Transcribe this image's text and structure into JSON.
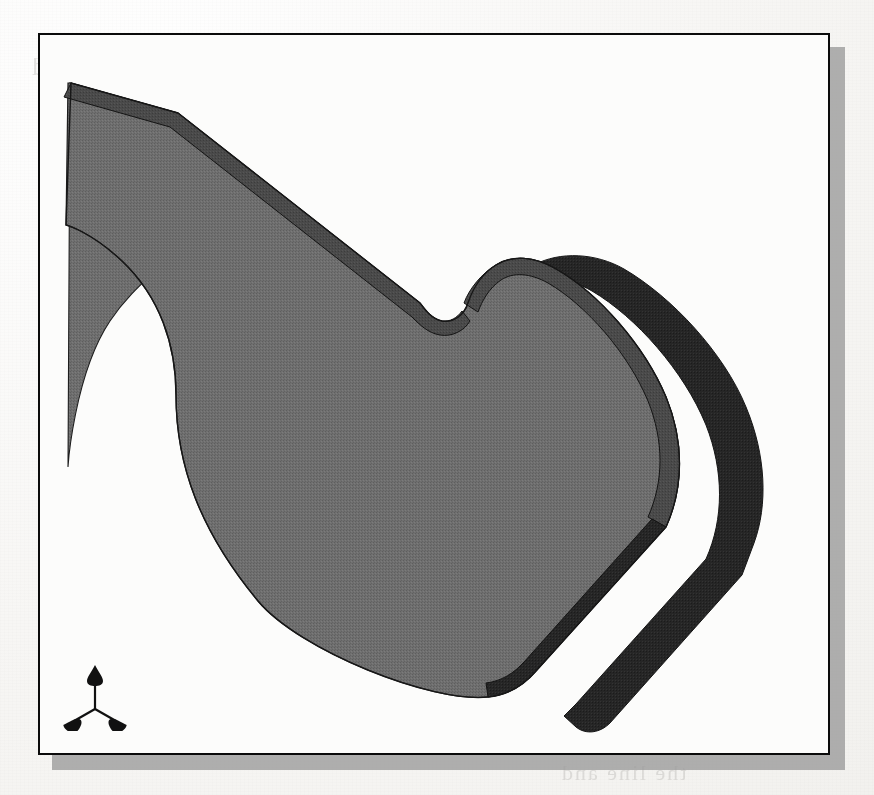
{
  "document": {
    "kind": "scanned-book-page",
    "page_background_color": "#f6f5f2",
    "ghost_text_color": "#7d7a76"
  },
  "ghost_text": {
    "note": "Faint mirrored bleed-through from the reverse side of the scanned page; mostly illegible.",
    "lines": [
      {
        "text": "positions size and length the Child",
        "x": 30,
        "y": 52,
        "size": 26
      },
      {
        "text": "the previous dimension really the with",
        "x": 36,
        "y": 88,
        "size": 26
      },
      {
        "text": "as",
        "x": 430,
        "y": 126,
        "size": 18
      },
      {
        "text": "the the",
        "x": 200,
        "y": 202,
        "size": 17
      },
      {
        "text": "of a and the",
        "x": 560,
        "y": 188,
        "size": 17
      },
      {
        "text": "a line of the",
        "x": 150,
        "y": 476,
        "size": 16
      },
      {
        "text": "and the",
        "x": 620,
        "y": 520,
        "size": 16
      },
      {
        "text": "the of to a the",
        "x": 60,
        "y": 626,
        "size": 22
      },
      {
        "text": "and the for of",
        "x": 470,
        "y": 648,
        "size": 22
      },
      {
        "text": "a all the and Begins the right",
        "x": 40,
        "y": 694,
        "size": 27
      },
      {
        "text": "that to and as the of and",
        "x": 36,
        "y": 726,
        "size": 25
      },
      {
        "text": "the line and",
        "x": 560,
        "y": 760,
        "size": 22
      }
    ]
  },
  "figure": {
    "name": "cad-solid-model-viewport",
    "frame": {
      "border_color": "#0b0b0b",
      "fill_color": "#fcfcfb",
      "shadow_color": "#9a9a9a",
      "x": 38,
      "y": 33,
      "width": 792,
      "height": 722
    },
    "model": {
      "description": "Extruded sheet-metal style solid part shown in isometric shaded view",
      "top_face_color": "#6b6b6b",
      "bevel_edge_color": "#474747",
      "side_wall_color": "#262626",
      "outline_color": "#1a1a1a"
    },
    "triad": {
      "label": "coordinate-system-triad",
      "color": "#111111",
      "axes": [
        "up",
        "down-left",
        "down-right"
      ]
    }
  }
}
